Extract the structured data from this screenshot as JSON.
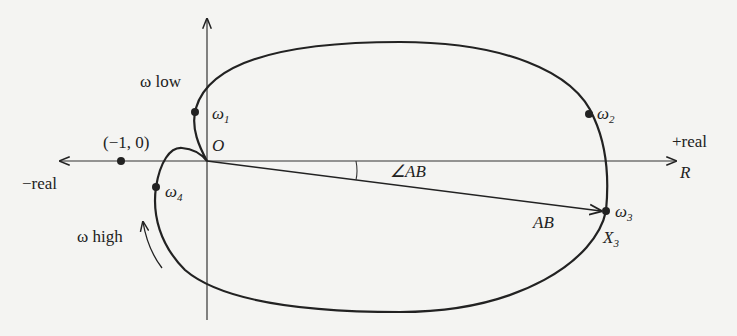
{
  "diagram": {
    "type": "polar-plot",
    "axes": {
      "negative_real_label": "−real",
      "positive_real_label": "+real",
      "positive_real_symbol": "R",
      "origin_label": "O"
    },
    "critical_point_label": "(−1, 0)",
    "frequency_labels": {
      "low": "ω low",
      "high": "ω high"
    },
    "points": [
      {
        "name": "ω",
        "sub": "1"
      },
      {
        "name": "ω",
        "sub": "2"
      },
      {
        "name": "ω",
        "sub": "3"
      },
      {
        "name": "ω",
        "sub": "4"
      }
    ],
    "vector": {
      "magnitude_label": "AB",
      "angle_label": "∠AB",
      "endpoint_label": "X",
      "endpoint_sub": "3"
    },
    "colors": {
      "ink": "#222222",
      "background": "#f4f4f2"
    }
  }
}
